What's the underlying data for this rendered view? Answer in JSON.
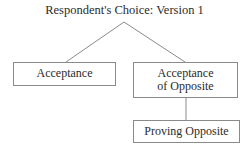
{
  "diagram": {
    "type": "tree-flowchart",
    "width": 249,
    "height": 148,
    "background_color": "#ffffff",
    "line_color": "#8a8a8a",
    "text_color": "#2b2b2b",
    "title": "Respondent's Choice: Version 1",
    "nodes": [
      {
        "id": "acceptance",
        "label": "Acceptance",
        "shape": "rectangle"
      },
      {
        "id": "acceptance-of-opposite",
        "label": "Acceptance\nof Opposite",
        "shape": "rectangle"
      },
      {
        "id": "proving-opposite",
        "label": "Proving Opposite",
        "shape": "rectangle"
      }
    ],
    "edges": [
      {
        "from": "title",
        "to": "acceptance"
      },
      {
        "from": "title",
        "to": "acceptance-of-opposite"
      },
      {
        "from": "acceptance-of-opposite",
        "to": "proving-opposite"
      }
    ]
  }
}
